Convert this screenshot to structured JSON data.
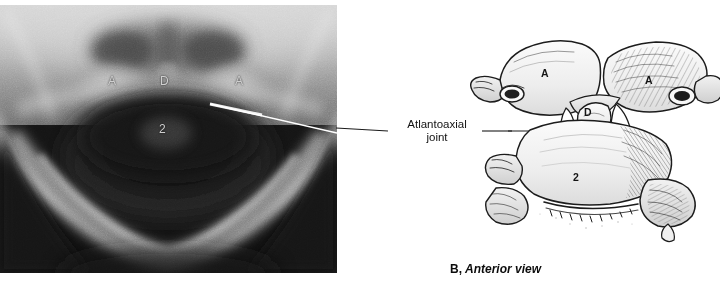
{
  "figure": {
    "caption_letter": "B,",
    "caption_title": "Anterior view"
  },
  "radiograph": {
    "panel_name": "open-mouth odontoid radiograph",
    "background_color": "#0d0d0d",
    "labels": [
      {
        "key": "a_left",
        "text": "A"
      },
      {
        "key": "dens",
        "text": "D"
      },
      {
        "key": "a_right",
        "text": "A"
      },
      {
        "key": "axis",
        "text": "2"
      }
    ]
  },
  "callout": {
    "text": "Atlantoaxial\njoint",
    "line_color": "#1a1a1a"
  },
  "drawing": {
    "panel_name": "anterior view line drawing of atlas and axis",
    "labels": [
      {
        "key": "a_left",
        "text": "A"
      },
      {
        "key": "a_right",
        "text": "A"
      },
      {
        "key": "dens",
        "text": "D"
      },
      {
        "key": "axis",
        "text": "2"
      }
    ]
  }
}
